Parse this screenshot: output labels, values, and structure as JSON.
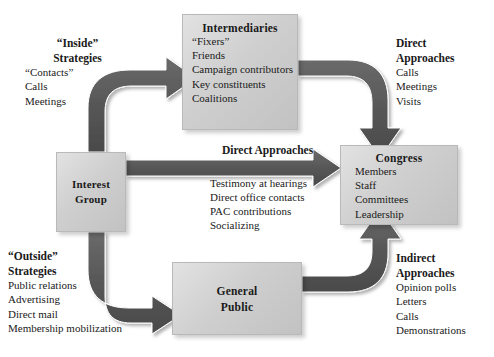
{
  "diagram": {
    "colors": {
      "box_fill": "#cfcfcf",
      "box_border": "#b9b9b9",
      "arrow_fill": "#595959",
      "text": "#1a1a1a",
      "background": "#ffffff"
    }
  },
  "nodes": {
    "intermediaries": {
      "title": "Intermediaries",
      "items": [
        "“Fixers”",
        "Friends",
        "Campaign contributors",
        "Key constituents",
        "Coalitions"
      ]
    },
    "congress": {
      "title": "Congress",
      "items": [
        "Members",
        "Staff",
        "Committees",
        "Leadership"
      ]
    },
    "interest_group": {
      "title_line1": "Interest",
      "title_line2": "Group"
    },
    "general_public": {
      "title_line1": "General",
      "title_line2": "Public"
    }
  },
  "annotations": {
    "inside_strategies": {
      "head_line1": "“Inside”",
      "head_line2": "Strategies",
      "items": [
        "“Contacts”",
        "Calls",
        "Meetings"
      ]
    },
    "direct_approaches_right": {
      "head_line1": "Direct",
      "head_line2": "Approaches",
      "items": [
        "Calls",
        "Meetings",
        "Visits"
      ]
    },
    "direct_approaches_center": {
      "head": "Direct Approaches",
      "items": [
        "Testimony at hearings",
        "Direct office contacts",
        "PAC contributions",
        "Socializing"
      ]
    },
    "outside_strategies": {
      "head_line1": "“Outside”",
      "head_line2": "Strategies",
      "items": [
        "Public relations",
        "Advertising",
        "Direct mail",
        "Membership mobilization"
      ]
    },
    "indirect_approaches": {
      "head_line1": "Indirect",
      "head_line2": "Approaches",
      "items": [
        "Opinion polls",
        "Letters",
        "Calls",
        "Demonstrations"
      ]
    }
  }
}
